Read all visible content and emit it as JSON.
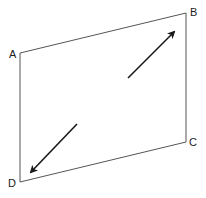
{
  "diagram": {
    "type": "quadrilateral-with-arrows",
    "colors": {
      "outline": "#555555",
      "arrow": "#1a1a1a",
      "label": "#222222",
      "background": "#ffffff"
    },
    "vertices": [
      {
        "label": "A",
        "x": 20,
        "y": 53,
        "label_x": 9,
        "label_y": 49
      },
      {
        "label": "B",
        "x": 186,
        "y": 13,
        "label_x": 190,
        "label_y": 7
      },
      {
        "label": "C",
        "x": 186,
        "y": 142,
        "label_x": 189,
        "label_y": 137
      },
      {
        "label": "D",
        "x": 20,
        "y": 182,
        "label_x": 8,
        "label_y": 178
      }
    ],
    "arrows": [
      {
        "name": "arrow-up-right",
        "x1": 128,
        "y1": 78,
        "x2": 174,
        "y2": 32
      },
      {
        "name": "arrow-down-left",
        "x1": 77,
        "y1": 124,
        "x2": 31,
        "y2": 172
      }
    ]
  }
}
